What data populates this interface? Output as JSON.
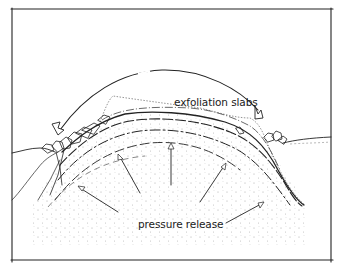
{
  "diagram": {
    "type": "geological cross-section sketch",
    "labels": {
      "exfoliation": "exfoliation slabs",
      "pressure": "pressure release"
    },
    "elements": {
      "frame": "rectangular border",
      "dome_layers": 5,
      "pressure_arrows": 5,
      "slab_arrows": 2
    },
    "colors": {
      "ink": "#222222",
      "stipple": "#888888",
      "background": "#ffffff"
    }
  }
}
